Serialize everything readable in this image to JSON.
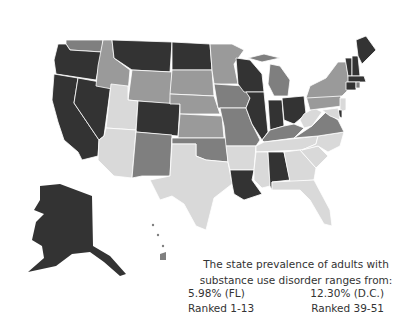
{
  "legend": {
    "caption_line1": "The state prevalence of adults with",
    "caption_line2": "substance use disorder ranges from:",
    "low": {
      "value": "5.98% (FL)",
      "rank": "Ranked 1-13"
    },
    "high": {
      "value": "12.30% (D.C.)",
      "rank": "Ranked 39-51"
    }
  },
  "colors": {
    "darkest": "#333333",
    "dark": "#7f7f7f",
    "medium": "#9a9a9a",
    "light": "#d9d9d9"
  }
}
